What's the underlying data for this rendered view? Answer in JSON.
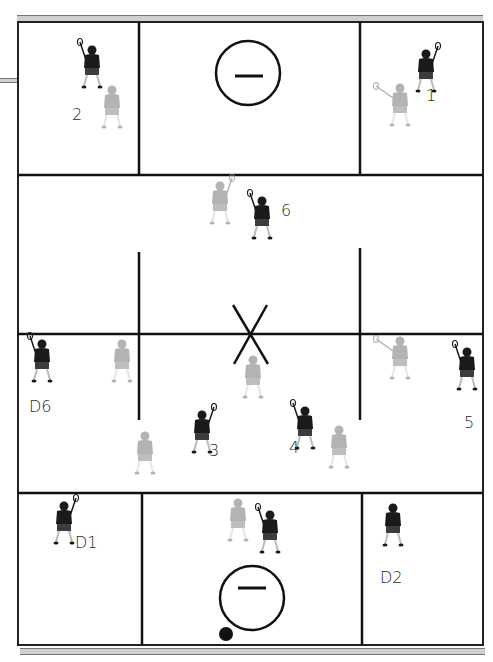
{
  "diagram": {
    "title": "",
    "colors": {
      "offense": "#1a1a1a",
      "defense": "#9a9a9a",
      "lines": "#111111",
      "sideband": "#cfcfcf",
      "background": "#ffffff"
    },
    "field": {
      "outer": {
        "left": 18,
        "top": 22,
        "right": 483,
        "bottom": 645
      },
      "top_box_line_y": 175,
      "midline_y": 334,
      "bottom_box_line_y": 493,
      "goal_circles": [
        {
          "name": "top-goal",
          "cx": 248,
          "cy": 73,
          "r": 32
        },
        {
          "name": "bottom-goal",
          "cx": 252,
          "cy": 598,
          "r": 32
        }
      ],
      "center_mark": "X",
      "ball": {
        "cx": 226,
        "cy": 634,
        "r": 7
      }
    },
    "labels": [
      {
        "id": "2",
        "text": "2",
        "x": 72,
        "y": 107
      },
      {
        "id": "1",
        "text": "1",
        "x": 426,
        "y": 88
      },
      {
        "id": "6",
        "text": "6",
        "x": 281,
        "y": 203
      },
      {
        "id": "D6",
        "text": "D6",
        "x": 29,
        "y": 399
      },
      {
        "id": "3",
        "text": "3",
        "x": 209,
        "y": 443
      },
      {
        "id": "4",
        "text": "4",
        "x": 289,
        "y": 440
      },
      {
        "id": "5",
        "text": "5",
        "x": 464,
        "y": 415
      },
      {
        "id": "D1",
        "text": "D1",
        "x": 75,
        "y": 535
      },
      {
        "id": "D2",
        "text": "D2",
        "x": 380,
        "y": 570
      }
    ],
    "players": [
      {
        "team": "offense",
        "role": "attack-2",
        "x": 80,
        "y": 46,
        "stick": "left"
      },
      {
        "team": "defense",
        "role": "defender-on-2",
        "x": 100,
        "y": 86,
        "stick": "none"
      },
      {
        "team": "offense",
        "role": "attack-1",
        "x": 414,
        "y": 50,
        "stick": "right"
      },
      {
        "team": "defense",
        "role": "defender-on-1",
        "x": 388,
        "y": 84,
        "stick": "left-long"
      },
      {
        "team": "defense",
        "role": "defender-on-6",
        "x": 208,
        "y": 182,
        "stick": "right"
      },
      {
        "team": "offense",
        "role": "midfield-6",
        "x": 250,
        "y": 197,
        "stick": "left"
      },
      {
        "team": "offense",
        "role": "D6",
        "x": 30,
        "y": 340,
        "stick": "left"
      },
      {
        "team": "defense",
        "role": "wing-defender-left",
        "x": 110,
        "y": 340,
        "stick": "none"
      },
      {
        "team": "defense",
        "role": "center-defender",
        "x": 241,
        "y": 356,
        "stick": "none"
      },
      {
        "team": "defense",
        "role": "wing-defender-right",
        "x": 388,
        "y": 337,
        "stick": "left-long"
      },
      {
        "team": "offense",
        "role": "midfield-5",
        "x": 455,
        "y": 348,
        "stick": "left"
      },
      {
        "team": "defense",
        "role": "defender-on-3",
        "x": 133,
        "y": 432,
        "stick": "none"
      },
      {
        "team": "offense",
        "role": "midfield-3",
        "x": 190,
        "y": 411,
        "stick": "right"
      },
      {
        "team": "offense",
        "role": "midfield-4",
        "x": 293,
        "y": 407,
        "stick": "left"
      },
      {
        "team": "defense",
        "role": "defender-on-4",
        "x": 327,
        "y": 426,
        "stick": "none"
      },
      {
        "team": "offense",
        "role": "D1",
        "x": 52,
        "y": 502,
        "stick": "right"
      },
      {
        "team": "defense",
        "role": "goalie-area-defender",
        "x": 226,
        "y": 499,
        "stick": "none"
      },
      {
        "team": "offense",
        "role": "crease-player",
        "x": 258,
        "y": 511,
        "stick": "left"
      },
      {
        "team": "offense",
        "role": "D2",
        "x": 381,
        "y": 504,
        "stick": "none"
      }
    ]
  }
}
